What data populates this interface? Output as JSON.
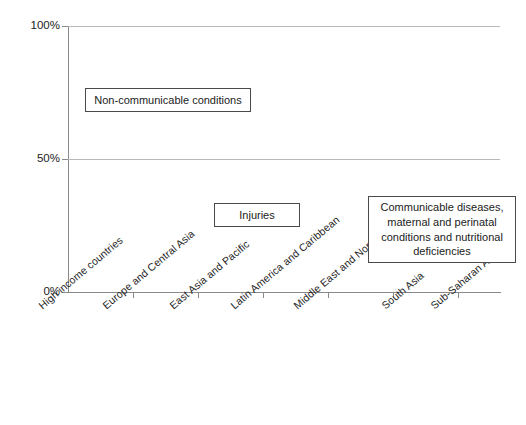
{
  "chart_data": {
    "type": "bar",
    "subtype": "stacked-100-percent-vertical",
    "title": "",
    "xlabel": "",
    "ylabel": "",
    "ylim": [
      0,
      100
    ],
    "yticks": [
      0,
      50,
      100
    ],
    "ytick_labels": [
      "0%",
      "50%",
      "100%"
    ],
    "grid": true,
    "grid_axis": "y",
    "legend_position": "in-plot-callouts",
    "units": "percent",
    "categories": [
      "High income countries",
      "Europe and Central Asia",
      "East Asia and Pacific",
      "Latin America and Caribbean",
      "Middle East and North Africa",
      "South Asia",
      "Sub-Saharan Africa"
    ],
    "series": [
      {
        "name": "Communicable diseases, maternal and perinatal conditions and nutritional deficiencies",
        "short_name": "Communicable",
        "color": "#545454",
        "values": [
          5.5,
          9.5,
          19,
          20,
          26,
          45,
          67
        ]
      },
      {
        "name": "Injuries",
        "short_name": "Injuries",
        "color": "#c3c3c3",
        "values": [
          6.5,
          14,
          11.5,
          13.5,
          16.5,
          8.5,
          8
        ]
      },
      {
        "name": "Non-communicable conditions",
        "short_name": "Non-communicable",
        "color": "#787878",
        "values": [
          88,
          76.5,
          69.5,
          66.5,
          57.5,
          46.5,
          25
        ]
      }
    ],
    "callouts": [
      {
        "id": "ncd",
        "text": "Non-communicable conditions"
      },
      {
        "id": "inj",
        "text": "Injuries"
      },
      {
        "id": "com",
        "lines": [
          "Communicable diseases,",
          "maternal and perinatal",
          "conditions and nutritional",
          "deficiencies"
        ]
      }
    ]
  },
  "axis": {
    "y": {
      "tick_100": "100%",
      "tick_50": "50%",
      "tick_0": "0%"
    }
  },
  "callouts": {
    "ncd_label": "Non-communicable conditions",
    "inj_label": "Injuries",
    "com_line1": "Communicable diseases,",
    "com_line2": "maternal and perinatal",
    "com_line3": "conditions and nutritional",
    "com_line4": "deficiencies"
  },
  "categories": {
    "c0": "High income countries",
    "c1": "Europe and Central Asia",
    "c2": "East Asia and Pacific",
    "c3": "Latin America and Caribbean",
    "c4": "Middle East and North Africa",
    "c5": "South Asia",
    "c6": "Sub-Saharan Africa"
  },
  "colors": {
    "non_communicable": "#787878",
    "injuries": "#c3c3c3",
    "communicable": "#545454",
    "axis": "#8a8a8a",
    "grid": "#b9b9b9"
  }
}
